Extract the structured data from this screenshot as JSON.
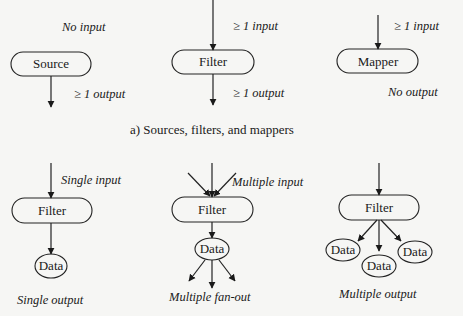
{
  "figure": {
    "panel_a": {
      "caption": "a) Sources, filters, and mappers",
      "source": {
        "node_label": "Source",
        "input_label": "No input",
        "output_label": "≥ 1  output"
      },
      "filter": {
        "node_label": "Filter",
        "input_label": "≥ 1  input",
        "output_label": "≥ 1  output"
      },
      "mapper": {
        "node_label": "Mapper",
        "input_label": "≥ 1  input",
        "output_label": "No output"
      }
    },
    "panel_b": {
      "single": {
        "node_label": "Filter",
        "input_label": "Single input",
        "data_labels": [
          "Data"
        ],
        "caption": "Single output"
      },
      "fanout": {
        "node_label": "Filter",
        "input_label": "Multiple input",
        "data_labels": [
          "Data"
        ],
        "caption": "Multiple fan-out"
      },
      "multi": {
        "node_label": "Filter",
        "data_labels": [
          "Data",
          "Data",
          "Data"
        ],
        "caption": "Multiple output"
      }
    }
  },
  "colors": {
    "background": "#f6f6f4",
    "ink": "#1a1a1a"
  }
}
